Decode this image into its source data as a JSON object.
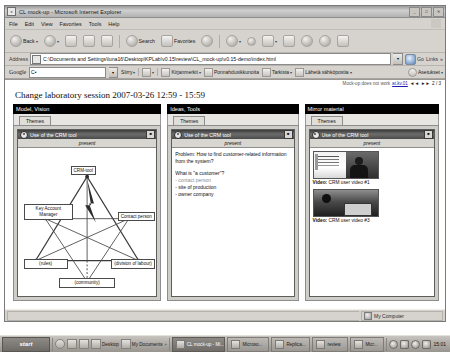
{
  "window": {
    "title": "CL mock-up - Microsoft Internet Explorer",
    "app_icon": "ie-document-icon",
    "minimize": "_",
    "maximize": "□",
    "close": "✕"
  },
  "menu": {
    "items": [
      "File",
      "Edit",
      "View",
      "Favorites",
      "Tools",
      "Help"
    ]
  },
  "toolbar": {
    "back": "Back",
    "forward": "",
    "stop": "",
    "refresh": "",
    "home": "",
    "search": "Search",
    "favorites": "Favorites",
    "history": "",
    "mail": "",
    "print": "",
    "edit": "",
    "discuss": "",
    "messenger": "",
    "media": "",
    "research": ""
  },
  "address": {
    "label": "Address",
    "value": "C:\\Documents and Settings\\luna16\\Desktop\\KPLab\\v0.15\\review\\CL_mock-up\\v0.15-demo\\index.html",
    "go_label": "Go",
    "links_label": "Links"
  },
  "google_toolbar": {
    "logo": "Google",
    "search_value": "C•",
    "items": [
      {
        "label": "Siirry",
        "icon": "go-icon"
      },
      {
        "label": "",
        "icon": "google-search-icon"
      },
      {
        "label": "Kirjanmerkit",
        "icon": "star-icon"
      },
      {
        "label": "Ponnahdusikkunoita",
        "icon": "popup-blocker-icon"
      },
      {
        "label": "Tarkista",
        "icon": "spellcheck-icon"
      },
      {
        "label": "Lähetä sähköpostia",
        "icon": "mail-icon"
      }
    ],
    "settings": "Asetukset"
  },
  "page": {
    "title": "Change laboratory session 2007-03-26 12:59 - 15:59",
    "meta_note": "Mock-up does not work",
    "meta_link": "at.kv.01",
    "meta_prev": "◄◄",
    "meta_next": "►►",
    "meta_counter": "2 / 3"
  },
  "columns": [
    {
      "header": "Model, Vision",
      "tab": "Themes",
      "card": {
        "title": "Use of the CRM tool",
        "subtab": "present",
        "menu_btn": "■",
        "icon": "record-circle-icon"
      },
      "diagram": {
        "type": "activity-system-triangle",
        "nodes": {
          "instrument": "CRM-tool",
          "subject": "Key Account Manager",
          "object": "Contact person",
          "rules": "(rules)",
          "community": "(community)",
          "division": "(division of labour)"
        }
      }
    },
    {
      "header": "Ideas, Tools",
      "tab": "Themes",
      "card": {
        "title": "Use of the CRM tool",
        "subtab": "present",
        "menu_btn": "■",
        "icon": "record-circle-icon"
      },
      "note": {
        "problem": "Problem: How to find customer-related information from the system?",
        "question": "What is \"a customer\"?",
        "bullets": [
          {
            "text": "- contact person",
            "dim": true
          },
          {
            "text": "- site of production",
            "dim": false
          },
          {
            "text": "- owner company",
            "dim": false
          }
        ]
      }
    },
    {
      "header": "Mirror material",
      "tab": "Themes",
      "card": {
        "title": "Use of the CRM tool",
        "subtab": "present",
        "menu_btn": "■",
        "icon": "record-circle-icon"
      },
      "videos": [
        {
          "prefix": "Video:",
          "label": " CRM user video #1",
          "thumb": "screen-and-person"
        },
        {
          "prefix": "Video:",
          "label": " CRM user video #3",
          "thumb": "office-scene"
        }
      ]
    }
  ],
  "statusbar": {
    "done": "",
    "zone_icon": "my-computer-icon",
    "zone": "My Computer"
  },
  "taskbar": {
    "start": "start",
    "quicklaunch": [
      {
        "label": "",
        "icon": "show-desktop-icon"
      },
      {
        "label": "",
        "icon": "ie-icon"
      },
      {
        "label": "",
        "icon": "media-icon"
      },
      {
        "label": "Desktop",
        "icon": "desktop-icon"
      },
      {
        "label": "My Documents",
        "icon": "folder-icon"
      }
    ],
    "tasks": [
      {
        "label": "CL mock-up - Mi...",
        "active": true,
        "icon": "ie-icon"
      },
      {
        "label": "Microso...",
        "active": false,
        "icon": "word-icon"
      },
      {
        "label": "Replica...",
        "active": false,
        "icon": "app-icon"
      },
      {
        "label": "review",
        "active": false,
        "icon": "folder-icon"
      },
      {
        "label": "Micr...",
        "active": false,
        "icon": "word-icon"
      }
    ],
    "tray_icons": [
      "volume-icon",
      "network-icon",
      "shield-icon",
      "battery-icon"
    ],
    "clock": "15:01"
  }
}
